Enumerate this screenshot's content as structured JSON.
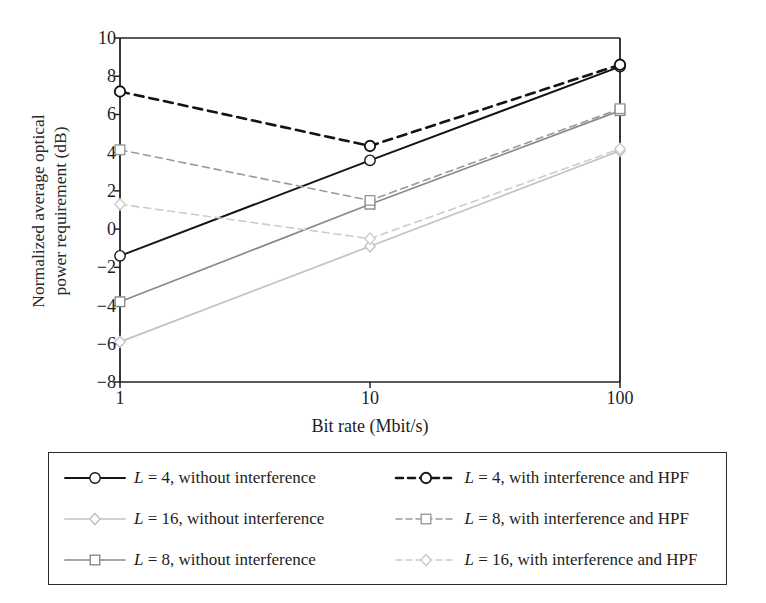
{
  "chart_data": {
    "type": "line",
    "title": "",
    "xlabel": "Bit rate (Mbit/s)",
    "ylabel": "Normalized average optical power requirement (dB)",
    "ylabel_lines": [
      "Normalized average optical",
      "power requirement (dB)"
    ],
    "x_scale": "log",
    "x": [
      1,
      10,
      100
    ],
    "x_tick_labels": [
      "1",
      "10",
      "100"
    ],
    "y_tick_labels": [
      "10",
      "8",
      "6",
      "4",
      "2",
      "0",
      "−2",
      "−4",
      "−6",
      "−8"
    ],
    "y_ticks": [
      10,
      8,
      6,
      4,
      2,
      0,
      -2,
      -4,
      -6,
      -8
    ],
    "ylim": [
      -8,
      10
    ],
    "xlim": [
      1,
      100
    ],
    "grid": false,
    "legend_position": "below-axes",
    "series": [
      {
        "name": "L = 4, without interference",
        "label_prefix": "L",
        "label_rest": " = 4, without interference",
        "values": [
          -1.4,
          3.6,
          8.5
        ],
        "color": "#141414",
        "style": "solid",
        "marker": "circle",
        "width": 1.9
      },
      {
        "name": "L = 8, without interference",
        "label_prefix": "L",
        "label_rest": " = 8, without interference",
        "values": [
          -3.8,
          1.3,
          6.2
        ],
        "color": "#8a8a8a",
        "style": "solid",
        "marker": "square",
        "width": 1.7
      },
      {
        "name": "L = 16, without interference",
        "label_prefix": "L",
        "label_rest": " = 16, without interference",
        "values": [
          -5.9,
          -0.9,
          4.1
        ],
        "color": "#c2c2c2",
        "style": "solid",
        "marker": "diamond",
        "width": 1.7
      },
      {
        "name": "L = 4, with interference and HPF",
        "label_prefix": "L",
        "label_rest": " = 4, with interference and HPF",
        "values": [
          7.2,
          4.35,
          8.6
        ],
        "color": "#141414",
        "style": "dashed",
        "marker": "circle",
        "width": 2.6
      },
      {
        "name": "L = 8, with interference and HPF",
        "label_prefix": "L",
        "label_rest": " = 8, with interference and HPF",
        "values": [
          4.15,
          1.5,
          6.3
        ],
        "color": "#9a9a9a",
        "style": "dashed",
        "marker": "square",
        "width": 1.6
      },
      {
        "name": "L = 16, with interference and HPF",
        "label_prefix": "L",
        "label_rest": " = 16, with interference and HPF",
        "values": [
          1.3,
          -0.5,
          4.2
        ],
        "color": "#cccccc",
        "style": "dashed",
        "marker": "diamond",
        "width": 1.6
      }
    ]
  },
  "legend": {
    "order": [
      0,
      1,
      2,
      3,
      4,
      5
    ]
  }
}
